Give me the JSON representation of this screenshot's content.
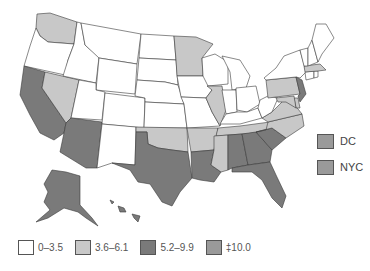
{
  "map": {
    "type": "choropleth",
    "region": "United States",
    "classes": {
      "c0": {
        "label": "0–3.5",
        "color": "#ffffff"
      },
      "c1": {
        "label": "3.6–6.1",
        "color": "#c8c8c8"
      },
      "c2": {
        "label": "5.2–9.9",
        "color": "#7a7a7a"
      },
      "c3": {
        "label": "‡10.0",
        "color": "#9a9a9a"
      }
    },
    "states": {
      "WA": "c1",
      "OR": "c0",
      "CA": "c2",
      "NV": "c1",
      "ID": "c0",
      "MT": "c0",
      "WY": "c0",
      "UT": "c0",
      "AZ": "c2",
      "CO": "c0",
      "NM": "c0",
      "ND": "c0",
      "SD": "c0",
      "NE": "c0",
      "KS": "c0",
      "OK": "c1",
      "TX": "c2",
      "MN": "c1",
      "IA": "c0",
      "MO": "c0",
      "AR": "c1",
      "LA": "c2",
      "WI": "c0",
      "IL": "c1",
      "MI": "c0",
      "IN": "c0",
      "OH": "c0",
      "KY": "c0",
      "TN": "c1",
      "MS": "c1",
      "AL": "c2",
      "GA": "c2",
      "FL": "c2",
      "SC": "c2",
      "NC": "c1",
      "VA": "c1",
      "WV": "c0",
      "PA": "c1",
      "NY": "c0",
      "NJ": "c2",
      "DE": "c1",
      "MD": "c1",
      "CT": "c0",
      "RI": "c0",
      "MA": "c1",
      "VT": "c0",
      "NH": "c0",
      "ME": "c0",
      "AK": "c2",
      "HI": "c2"
    },
    "insets": [
      {
        "label": "DC",
        "class": "c3"
      },
      {
        "label": "NYC",
        "class": "c3"
      }
    ]
  },
  "legend": {
    "items": [
      {
        "label": "0–3.5",
        "color": "#ffffff"
      },
      {
        "label": "3.6–6.1",
        "color": "#c8c8c8"
      },
      {
        "label": "5.2–9.9",
        "color": "#7a7a7a"
      },
      {
        "label": "‡10.0",
        "color": "#9a9a9a"
      }
    ]
  }
}
